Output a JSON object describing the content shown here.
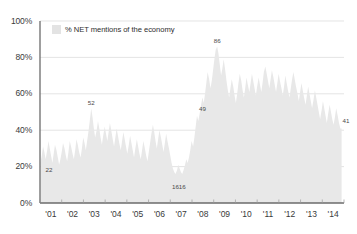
{
  "chart_data": {
    "type": "area",
    "title": "",
    "subtitle": "",
    "xlabel": "",
    "ylabel": "",
    "ylim": [
      0,
      100
    ],
    "ytick_labels": [
      "100%",
      "80%",
      "60%",
      "40%",
      "20%",
      "0%"
    ],
    "ytick_values": [
      100,
      80,
      60,
      40,
      20,
      0
    ],
    "xtick_labels": [
      "'01",
      "'02",
      "'03",
      "'04",
      "'05",
      "'06",
      "'07",
      "'08",
      "'09",
      "'10",
      "'11",
      "'12",
      "'13",
      "'14"
    ],
    "grid": "horizontal",
    "legend_position": "inside-top-left",
    "legend": [
      {
        "name": "% NET mentions of the economy",
        "color": "#e8e8e8"
      }
    ],
    "series": [
      {
        "name": "% NET mentions of the economy",
        "color": "#e8e8e8",
        "units": "percent",
        "x": [
          2001.02,
          2001.08,
          2001.14,
          2001.2,
          2001.26,
          2001.33,
          2001.39,
          2001.45,
          2001.51,
          2001.57,
          2001.63,
          2001.69,
          2001.76,
          2001.82,
          2001.88,
          2001.94,
          2002.0,
          2002.06,
          2002.13,
          2002.19,
          2002.25,
          2002.31,
          2002.37,
          2002.43,
          2002.5,
          2002.56,
          2002.62,
          2002.68,
          2002.74,
          2002.8,
          2002.87,
          2002.93,
          2002.99,
          2003.05,
          2003.11,
          2003.17,
          2003.24,
          2003.3,
          2003.36,
          2003.42,
          2003.48,
          2003.54,
          2003.61,
          2003.67,
          2003.73,
          2003.79,
          2003.85,
          2003.91,
          2003.98,
          2004.04,
          2004.1,
          2004.16,
          2004.22,
          2004.28,
          2004.35,
          2004.41,
          2004.47,
          2004.53,
          2004.59,
          2004.65,
          2004.72,
          2004.78,
          2004.84,
          2004.9,
          2004.96,
          2005.02,
          2005.09,
          2005.15,
          2005.21,
          2005.27,
          2005.33,
          2005.39,
          2005.46,
          2005.52,
          2005.58,
          2005.64,
          2005.7,
          2005.76,
          2005.83,
          2005.89,
          2005.95,
          2006.01,
          2006.07,
          2006.13,
          2006.2,
          2006.26,
          2006.32,
          2006.38,
          2006.44,
          2006.5,
          2006.57,
          2006.63,
          2006.69,
          2006.75,
          2006.81,
          2006.87,
          2006.94,
          2007.0,
          2007.06,
          2007.12,
          2007.18,
          2007.24,
          2007.31,
          2007.37,
          2007.43,
          2007.49,
          2007.55,
          2007.61,
          2007.68,
          2007.74,
          2007.8,
          2007.86,
          2007.92,
          2007.98,
          2008.05,
          2008.11,
          2008.17,
          2008.23,
          2008.29,
          2008.35,
          2008.42,
          2008.48,
          2008.54,
          2008.6,
          2008.66,
          2008.72,
          2008.79,
          2008.85,
          2008.91,
          2008.97,
          2009.03,
          2009.09,
          2009.16,
          2009.22,
          2009.28,
          2009.34,
          2009.4,
          2009.46,
          2009.53,
          2009.59,
          2009.65,
          2009.71,
          2009.77,
          2009.83,
          2009.9,
          2009.96,
          2010.02,
          2010.08,
          2010.14,
          2010.2,
          2010.27,
          2010.33,
          2010.39,
          2010.45,
          2010.51,
          2010.57,
          2010.64,
          2010.7,
          2010.76,
          2010.82,
          2010.88,
          2010.94,
          2011.0,
          2011.07,
          2011.13,
          2011.19,
          2011.25,
          2011.31,
          2011.38,
          2011.44,
          2011.5,
          2011.56,
          2011.62,
          2011.68,
          2011.75,
          2011.81,
          2011.87,
          2011.93,
          2011.99,
          2012.05,
          2012.12,
          2012.18,
          2012.24,
          2012.3,
          2012.36,
          2012.42,
          2012.49,
          2012.55,
          2012.61,
          2012.67,
          2012.73,
          2012.79,
          2012.86,
          2012.92,
          2012.98,
          2013.04,
          2013.1,
          2013.16,
          2013.23,
          2013.29,
          2013.35,
          2013.41,
          2013.47,
          2013.53,
          2013.6,
          2013.66,
          2013.72,
          2013.78,
          2013.84,
          2013.9,
          2013.97,
          2014.03,
          2014.09,
          2014.15,
          2014.21,
          2014.27,
          2014.34,
          2014.4,
          2014.46,
          2014.52,
          2014.58,
          2014.64,
          2014.71,
          2014.77,
          2014.83,
          2014.89
        ],
        "values": [
          22,
          26,
          31,
          28,
          24,
          29,
          34,
          30,
          26,
          22,
          27,
          32,
          29,
          25,
          21,
          24,
          28,
          33,
          30,
          26,
          23,
          28,
          34,
          31,
          27,
          24,
          29,
          35,
          32,
          28,
          25,
          30,
          36,
          33,
          29,
          34,
          40,
          46,
          52,
          47,
          41,
          36,
          40,
          45,
          41,
          36,
          32,
          37,
          42,
          38,
          34,
          39,
          44,
          40,
          35,
          31,
          36,
          41,
          37,
          33,
          29,
          34,
          39,
          35,
          31,
          27,
          32,
          37,
          33,
          29,
          25,
          30,
          35,
          31,
          27,
          24,
          29,
          34,
          30,
          26,
          23,
          28,
          33,
          38,
          43,
          39,
          34,
          30,
          35,
          40,
          36,
          32,
          28,
          33,
          38,
          34,
          30,
          26,
          22,
          19,
          17,
          16,
          18,
          21,
          19,
          17,
          16,
          18,
          21,
          24,
          22,
          25,
          29,
          34,
          31,
          36,
          42,
          48,
          45,
          49,
          54,
          58,
          55,
          60,
          66,
          72,
          68,
          63,
          67,
          73,
          79,
          84,
          86,
          82,
          76,
          70,
          74,
          79,
          73,
          67,
          62,
          58,
          63,
          68,
          64,
          59,
          55,
          60,
          66,
          71,
          67,
          62,
          58,
          63,
          69,
          65,
          61,
          66,
          71,
          67,
          63,
          59,
          64,
          69,
          65,
          61,
          66,
          72,
          75,
          71,
          67,
          63,
          68,
          73,
          69,
          65,
          61,
          66,
          71,
          67,
          63,
          59,
          64,
          70,
          66,
          62,
          58,
          63,
          68,
          72,
          68,
          64,
          60,
          56,
          61,
          66,
          62,
          58,
          54,
          59,
          64,
          60,
          56,
          52,
          57,
          62,
          58,
          54,
          50,
          46,
          51,
          56,
          52,
          48,
          44,
          49,
          54,
          50,
          46,
          43,
          47,
          52,
          48,
          44,
          41,
          41
        ]
      }
    ],
    "annotations": [
      {
        "label": "22",
        "x": 2001.02,
        "y": 22
      },
      {
        "label": "52",
        "x": 2003.36,
        "y": 52
      },
      {
        "label": "16",
        "x": 2007.24,
        "y": 16
      },
      {
        "label": "16",
        "x": 2007.55,
        "y": 16
      },
      {
        "label": "49",
        "x": 2008.48,
        "y": 49
      },
      {
        "label": "86",
        "x": 2009.16,
        "y": 86
      },
      {
        "label": "41",
        "x": 2014.89,
        "y": 41
      }
    ]
  }
}
